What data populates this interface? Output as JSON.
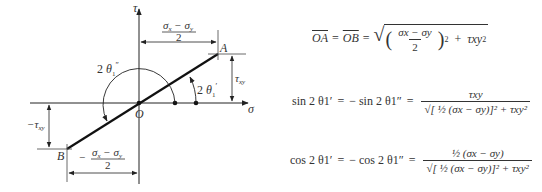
{
  "diagram": {
    "type": "mohr_circle_geometry",
    "axes": {
      "horizontal": "σ",
      "vertical": "τ",
      "origin": "O"
    },
    "points": {
      "A": {
        "label": "A"
      },
      "B": {
        "label": "B"
      },
      "O": {
        "label": "O"
      }
    },
    "dimensions": {
      "top_width": {
        "numerator": "σx − σy",
        "denominator": "2"
      },
      "bottom_width": {
        "prefix": "−",
        "numerator": "σx − σy",
        "denominator": "2"
      },
      "right_height": "τxy",
      "left_height": "−τxy"
    },
    "angles": {
      "double_prime": "2 θ1″",
      "prime": "2 θ1′"
    }
  },
  "equations": {
    "eq1": {
      "lhs1": "OA",
      "lhs2": "OB",
      "frac_num": "σx − σy",
      "frac_den": "2",
      "term2": "τxy"
    },
    "eq2": {
      "lhs": "sin 2 θ1′",
      "mid": "− sin 2 θ1″",
      "numerator": "τxy",
      "denominator": "[ ½ (σx − σy)]² + τxy²"
    },
    "eq3": {
      "lhs": "cos 2 θ1′",
      "mid": "− cos 2 θ1″",
      "numerator": "½ (σx − σy)",
      "denominator": "[ ½ (σx − σy)]² + τxy²"
    }
  }
}
